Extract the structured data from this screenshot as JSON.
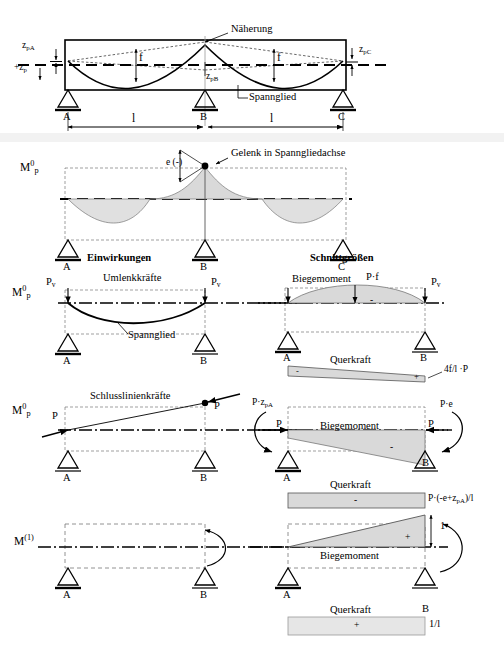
{
  "document": {
    "language": "de",
    "title": "Spannglied - Momenten- und Querkraftverlaeufe am Zweifeldtraeger",
    "supports": {
      "A": "A",
      "B": "B",
      "C": "C"
    }
  },
  "colors": {
    "ink": "#000000",
    "shade": "#d9d9d9",
    "shade_light": "#e6e6e6",
    "band": "#f2f2f2",
    "thin": "#555555"
  },
  "row1": {
    "name": "tendon-geometry",
    "labels": {
      "naeherung": "Näherung",
      "spannglied": "Spannglied",
      "z_pA": "z",
      "z_pA_sub": "pA",
      "z_p": "+z",
      "z_p_sub": "p",
      "z_pB": "z",
      "z_pB_sub": "pB",
      "z_pC": "z",
      "z_pC_sub": "pC",
      "f_left": "f",
      "f_right": "f",
      "span_left": "l",
      "span_right": "l",
      "support_a": "A",
      "support_b": "B",
      "support_c": "C"
    }
  },
  "row2": {
    "name": "mp0-two-span",
    "labels": {
      "symbol_M": "M",
      "symbol_sup": "0",
      "symbol_sub": "p",
      "gelenk": "Gelenk in Spanngliedachse",
      "e_minus": "e",
      "e_sign": "(-)",
      "support_a": "A",
      "support_b": "B",
      "support_c": "C"
    }
  },
  "headers": {
    "left": "Einwirkungen",
    "right": "Schnittgrößen"
  },
  "row3": {
    "name": "umlenkkraefte",
    "left": {
      "symbol_M": "M",
      "symbol_sup": "0",
      "symbol_sub": "p",
      "title": "Umlenkkräfte",
      "force_left": "P",
      "force_left_sub": "v",
      "force_right": "P",
      "force_right_sub": "v",
      "tendon": "Spannglied",
      "support_a": "A",
      "support_b": "B"
    },
    "right": {
      "moment_label": "Biegemoment",
      "peak_label": "P·f",
      "force_right": "P",
      "force_right_sub": "v",
      "shear_label": "Querkraft",
      "shear_value": "4f/l ·P",
      "sign_minus": "-",
      "sign_plus": "+",
      "shear_sign_minus": "-",
      "shear_sign_plus": "+",
      "support_a": "A",
      "support_b": "B"
    }
  },
  "row4": {
    "name": "schlusslinienkraefte",
    "left": {
      "symbol_M": "M",
      "symbol_sup": "0",
      "symbol_sub": "p",
      "title": "Schlusslinienkräfte",
      "force_left": "P",
      "force_right": "P",
      "support_a": "A",
      "support_b": "B"
    },
    "right": {
      "moment_a": "P·z",
      "moment_a_sub": "pA",
      "moment_b": "P·e",
      "force_left": "P",
      "force_right": "P",
      "moment_label": "Biegemoment",
      "sign_minus": "-",
      "shear_label": "Querkraft",
      "shear_sign": "-",
      "shear_value": "P·(-e+z",
      "shear_value_sub": "pA",
      "shear_value_tail": ")/l",
      "support_a": "A",
      "support_b": "B"
    }
  },
  "row5": {
    "name": "m1-unit-state",
    "left": {
      "symbol_M": "M",
      "symbol_sup": "(1)",
      "support_a": "A",
      "support_b": "B"
    },
    "right": {
      "moment_label": "Biegemoment",
      "sign_plus": "+",
      "peak_value": "1",
      "shear_label": "Querkraft",
      "shear_sign": "+",
      "shear_value": "1/l",
      "support_a": "A",
      "support_b": "B"
    }
  }
}
